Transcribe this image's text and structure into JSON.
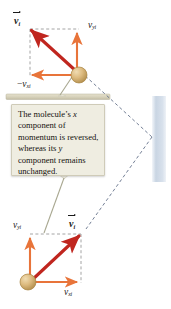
{
  "figure": {
    "background_color": "#ffffff",
    "colors": {
      "resultant_vector": "#c0261f",
      "component_vector": "#e8743a",
      "molecule_fill": "#d9b47a",
      "molecule_edge": "#a8823f",
      "dashed_construction": "#8a8a8a",
      "dashed_trajectory": "#4a5a7a",
      "wall_band": "#ccd7e4",
      "ledge": "#d8d3bd",
      "callout_fill": "#efede1",
      "callout_border": "#cfcbb8"
    }
  },
  "callout": {
    "name": "momentum-explanation-callout",
    "line1_a": "The molecule’s ",
    "line1_x": "x",
    "line1_b": " component of momentum is reversed, whereas its ",
    "line1_y": "y",
    "line1_c": " component remains unchanged."
  },
  "top_panel": {
    "name": "after-collision-panel",
    "resultant_label": {
      "symbol": "v",
      "subscript": "i",
      "accent": "vector-arrow"
    },
    "vertical_component_label": {
      "symbol": "v",
      "subscript": "yi"
    },
    "horizontal_component_label": {
      "sign": "−",
      "symbol": "v",
      "subscript": "xi"
    }
  },
  "bottom_panel": {
    "name": "before-collision-panel",
    "resultant_label": {
      "symbol": "v",
      "subscript": "i",
      "accent": "vector-arrow"
    },
    "vertical_component_label": {
      "symbol": "v",
      "subscript": "yi"
    },
    "horizontal_component_label": {
      "symbol": "v",
      "subscript": "xi"
    }
  }
}
